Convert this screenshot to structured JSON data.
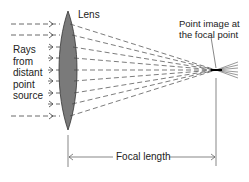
{
  "diagram": {
    "title_lens": "Lens",
    "rays_label": [
      "Rays",
      "from",
      "distant",
      "point",
      "source"
    ],
    "focal_point_label": [
      "Point image at",
      "the focal point"
    ],
    "focal_length_label": "Focal length",
    "colors": {
      "lens_fill": "#7a7a7a",
      "line": "#333333",
      "background": "#ffffff"
    },
    "ray_count": 9
  }
}
